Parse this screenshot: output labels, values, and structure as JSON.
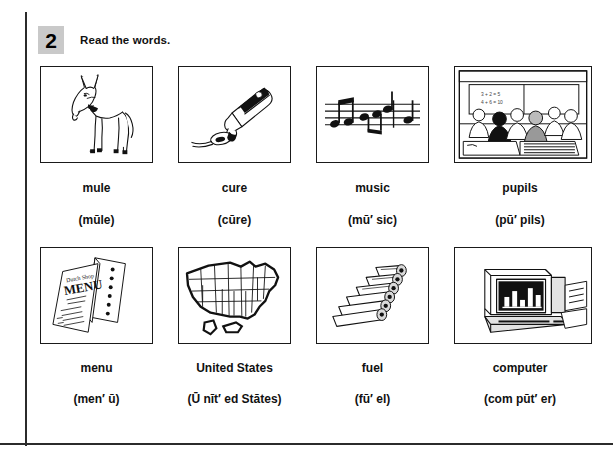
{
  "exercise": {
    "number": "2",
    "instruction": "Read the words."
  },
  "items": [
    {
      "word": "mule",
      "respelling": "(mūle)",
      "picture": "mule-illustration"
    },
    {
      "word": "cure",
      "respelling": "(cūre)",
      "picture": "medicine-bottle-spoon-illustration"
    },
    {
      "word": "music",
      "respelling": "(mū′ sic)",
      "picture": "music-staff-notes-illustration"
    },
    {
      "word": "pupils",
      "respelling": "(pū′ pils)",
      "picture": "classroom-pupils-illustration"
    },
    {
      "word": "menu",
      "respelling": "(men′ ū)",
      "picture": "restaurant-menu-illustration"
    },
    {
      "word": "United States",
      "respelling": "(Ū nīt′ ed Stātes)",
      "picture": "united-states-map-illustration"
    },
    {
      "word": "fuel",
      "respelling": "(fū′ el)",
      "picture": "firewood-logs-illustration"
    },
    {
      "word": "computer",
      "respelling": "(com pūt′ er)",
      "picture": "desktop-computer-illustration"
    }
  ],
  "colors": {
    "ink": "#111111",
    "rule": "#2b2b2b",
    "badge_bg": "#c9c9c9",
    "page_bg": "#ffffff"
  }
}
